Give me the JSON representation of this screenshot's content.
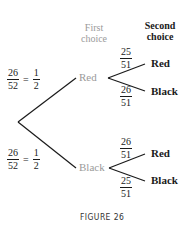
{
  "headers": {
    "first_choice": [
      "First",
      "choice"
    ],
    "second_choice": [
      "Second",
      "choice"
    ]
  },
  "first_level": {
    "red": {
      "label": "Red",
      "probability": {
        "num": "26",
        "den": "52",
        "simplified_num": "1",
        "simplified_den": "2",
        "equals": "="
      },
      "branches": [
        {
          "label": "Red",
          "num": "25",
          "den": "51"
        },
        {
          "label": "Black",
          "num": "26",
          "den": "51"
        }
      ]
    },
    "black": {
      "label": "Black",
      "probability": {
        "num": "26",
        "den": "52",
        "simplified_num": "1",
        "simplified_den": "2",
        "equals": "="
      },
      "branches": [
        {
          "label": "Red",
          "num": "26",
          "den": "51"
        },
        {
          "label": "Black",
          "num": "25",
          "den": "51"
        }
      ]
    }
  },
  "caption": "FIGURE 26",
  "colors": {
    "gray_text": "#9a9a9a",
    "dark_text": "#1a1a1a",
    "line": "#1a1a1a"
  }
}
